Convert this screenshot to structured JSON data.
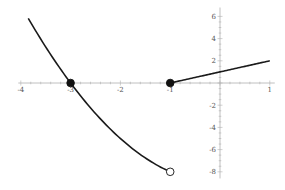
{
  "chart_data": {
    "type": "line",
    "title": "",
    "xlabel": "",
    "ylabel": "",
    "xlim": [
      -4.05,
      1.1
    ],
    "ylim": [
      -8.6,
      6.8
    ],
    "grid": false,
    "legend": null,
    "x_ticks": [
      -4,
      -3,
      -2,
      -1,
      1
    ],
    "x_tick_labels": [
      "-4",
      "-3",
      "-2",
      "-1",
      "1"
    ],
    "y_ticks": [
      -8,
      -6,
      -4,
      -2,
      2,
      4,
      6
    ],
    "y_tick_labels": [
      "-8",
      "-6",
      "-4",
      "-2",
      "2",
      "4",
      "6"
    ],
    "series": [
      {
        "name": "left piece",
        "formula": "x^2 - 9",
        "domain": [
          -3.85,
          -1
        ],
        "x": [
          -3.85,
          -3.5,
          -3,
          -2.5,
          -2,
          -1.5,
          -1
        ],
        "y": [
          5.82,
          3.25,
          0,
          -2.75,
          -5,
          -6.75,
          -8
        ],
        "color": "#1a1a1a"
      },
      {
        "name": "right piece",
        "formula": "x + 1",
        "domain": [
          -1,
          1
        ],
        "x": [
          -1,
          0,
          1
        ],
        "y": [
          0,
          1,
          2
        ],
        "color": "#1a1a1a"
      }
    ],
    "points": [
      {
        "x": -3,
        "y": 0,
        "style": "filled"
      },
      {
        "x": -1,
        "y": 0,
        "style": "filled"
      },
      {
        "x": -1,
        "y": -8,
        "style": "open"
      }
    ]
  }
}
